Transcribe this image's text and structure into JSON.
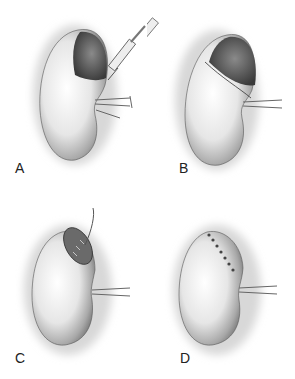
{
  "figure": {
    "panels": [
      {
        "id": "A",
        "label": "A",
        "description": "Kidney with upper pole lesion, syringe injecting"
      },
      {
        "id": "B",
        "label": "B",
        "description": "Kidney with demarcation line at upper pole"
      },
      {
        "id": "C",
        "label": "C",
        "description": "Upper pole resected, open defect with suture"
      },
      {
        "id": "D",
        "label": "D",
        "description": "Upper pole closed with sutures"
      }
    ],
    "colors": {
      "background": "#ffffff",
      "ink": "#333333",
      "shade": "#8a8a8a",
      "dark_lesion": "#4a4a4a"
    }
  }
}
